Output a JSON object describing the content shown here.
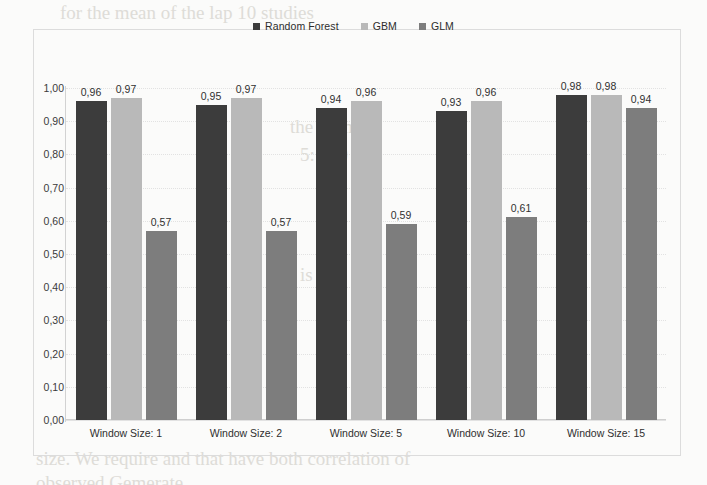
{
  "chart_data": {
    "type": "bar",
    "title": "",
    "xlabel": "",
    "ylabel": "",
    "ylim": [
      0,
      1
    ],
    "grid": true,
    "legend_position": "top-center",
    "decimal_separator": ",",
    "categories": [
      "Window Size: 1",
      "Window Size: 2",
      "Window Size: 5",
      "Window Size: 10",
      "Window Size: 15"
    ],
    "ytick_labels": [
      "1,00",
      "0,90",
      "0,80",
      "0,70",
      "0,60",
      "0,50",
      "0,40",
      "0,30",
      "0,20",
      "0,10",
      "0,00"
    ],
    "ytick_values": [
      1.0,
      0.9,
      0.8,
      0.7,
      0.6,
      0.5,
      0.4,
      0.3,
      0.2,
      0.1,
      0.0
    ],
    "series": [
      {
        "name": "Random Forest",
        "color": "#3c3c3c",
        "values": [
          0.96,
          0.95,
          0.94,
          0.93,
          0.98
        ],
        "labels": [
          "0,96",
          "0,95",
          "0,94",
          "0,93",
          "0,98"
        ]
      },
      {
        "name": "GBM",
        "color": "#b9b9b9",
        "values": [
          0.97,
          0.97,
          0.96,
          0.96,
          0.98
        ],
        "labels": [
          "0,97",
          "0,97",
          "0,96",
          "0,96",
          "0,98"
        ]
      },
      {
        "name": "GLM",
        "color": "#7d7d7d",
        "values": [
          0.57,
          0.57,
          0.59,
          0.61,
          0.94
        ],
        "labels": [
          "0,57",
          "0,57",
          "0,59",
          "0,61",
          "0,94"
        ]
      }
    ]
  },
  "legend": {
    "items": [
      {
        "label": "Random Forest",
        "color": "#3c3c3c",
        "marker": "square-marker"
      },
      {
        "label": "GBM",
        "color": "#b9b9b9",
        "marker": "square-marker"
      },
      {
        "label": "GLM",
        "color": "#7d7d7d",
        "marker": "square-marker"
      }
    ]
  },
  "background_artifacts": [
    {
      "text": "for the mean of the lap 10 studies",
      "x": 60,
      "y": 6
    },
    {
      "text": "the normal",
      "x": 290,
      "y": 120
    },
    {
      "text": "5: 300",
      "x": 300,
      "y": 148
    },
    {
      "text": "to",
      "x": 80,
      "y": 268
    },
    {
      "text": "is",
      "x": 300,
      "y": 268
    },
    {
      "text": "size. We require and that have both correlation of",
      "x": 40,
      "y": 452
    },
    {
      "text": "observed Gemerate",
      "x": 40,
      "y": 478
    }
  ]
}
